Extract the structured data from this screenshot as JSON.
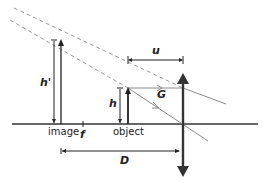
{
  "labels": {
    "image": "image",
    "object": "object",
    "focal": "f",
    "object_height": "h",
    "image_height": "h'",
    "object_distance": "u",
    "image_distance": "D",
    "angle": "G"
  },
  "colors": {
    "ink": "#222222",
    "ray": "#8a8a8a",
    "dashed": "#9a9a9a",
    "background": "#ffffff"
  },
  "geometry": {
    "axis_y": 124,
    "lens_x": 183,
    "object_x": 128,
    "object_top_y": 88,
    "image_x": 61,
    "image_top_y": 39
  }
}
